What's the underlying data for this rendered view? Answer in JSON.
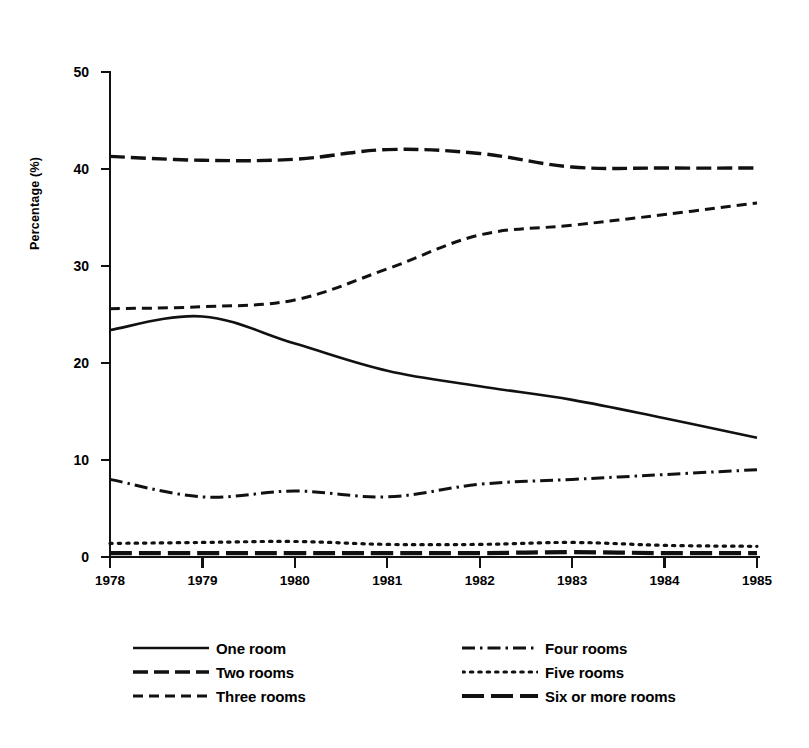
{
  "chart_data": {
    "type": "line",
    "title": "",
    "subtitle": "",
    "xlabel": "",
    "ylabel": "Percentage (%)",
    "categories": [
      "1978",
      "1979",
      "1980",
      "1981",
      "1982",
      "1983",
      "1984",
      "1985"
    ],
    "x": [
      1978,
      1979,
      1980,
      1981,
      1982,
      1983,
      1984,
      1985
    ],
    "xlim": [
      1978,
      1985
    ],
    "ylim": [
      0,
      50
    ],
    "yticks": [
      0,
      10,
      20,
      30,
      40,
      50
    ],
    "ytick_labels": [
      "0",
      "10",
      "20",
      "30",
      "40",
      "50"
    ],
    "xtick_labels": [
      "1978",
      "1979",
      "1980",
      "1981",
      "1982",
      "1983",
      "1984",
      "1985"
    ],
    "grid": false,
    "legend_position": "bottom",
    "series": [
      {
        "name": "One room",
        "style": "solid",
        "values": [
          23.4,
          24.8,
          22.0,
          19.2,
          17.6,
          16.2,
          14.3,
          12.3
        ]
      },
      {
        "name": "Two rooms",
        "style": "long-dash",
        "values": [
          41.3,
          40.9,
          41.0,
          42.0,
          41.6,
          40.2,
          40.1,
          40.1
        ]
      },
      {
        "name": "Three rooms",
        "style": "dash",
        "values": [
          25.6,
          25.8,
          26.5,
          29.7,
          33.2,
          34.2,
          35.3,
          36.5
        ]
      },
      {
        "name": "Four rooms",
        "style": "dash-dot",
        "values": [
          8.0,
          6.2,
          6.8,
          6.2,
          7.5,
          8.0,
          8.5,
          9.0
        ]
      },
      {
        "name": "Five rooms",
        "style": "dot",
        "values": [
          1.4,
          1.5,
          1.6,
          1.3,
          1.3,
          1.5,
          1.2,
          1.1
        ]
      },
      {
        "name": "Six or more rooms",
        "style": "long-dash-thick",
        "values": [
          0.4,
          0.4,
          0.4,
          0.4,
          0.4,
          0.5,
          0.4,
          0.4
        ]
      }
    ]
  },
  "axis": {
    "y_label": "Percentage (%)",
    "y_ticks": [
      "50",
      "40",
      "30",
      "20",
      "10",
      "0"
    ],
    "x_ticks": [
      "1978",
      "1979",
      "1980",
      "1981",
      "1982",
      "1983",
      "1984",
      "1985"
    ]
  },
  "legend": {
    "left_column": [
      {
        "label": "One room",
        "style": "solid"
      },
      {
        "label": "Two rooms",
        "style": "long-dash"
      },
      {
        "label": "Three rooms",
        "style": "dash"
      }
    ],
    "right_column": [
      {
        "label": "Four rooms",
        "style": "dash-dot"
      },
      {
        "label": "Five rooms",
        "style": "dot"
      },
      {
        "label": "Six or more rooms",
        "style": "long-dash-thick"
      }
    ]
  },
  "colors": {
    "ink": "#111111",
    "paper": "#ffffff"
  }
}
